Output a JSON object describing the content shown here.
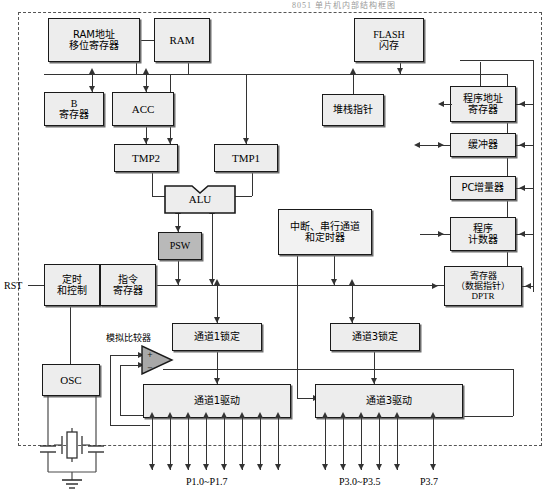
{
  "diagram": {
    "title": "8051 单片机内部结构框图",
    "external_labels": {
      "rst": "RST",
      "comparator": "模拟比较器",
      "port1_pins": "P1.0~P1.7",
      "port3_pins": "P3.0~P3.5",
      "port37_pin": "P3.7"
    },
    "blocks": {
      "ram_addr": "RAM地址\n移位寄存器",
      "ram_addr_l1": "RAM地址",
      "ram_addr_l2": "移位寄存器",
      "ram": "RAM",
      "flash_l1": "FLASH",
      "flash_l2": "闪存",
      "breg_l1": "B",
      "breg_l2": "寄存器",
      "acc": "ACC",
      "stack_pointer": "堆栈指针",
      "prog_addr_l1": "程序地址",
      "prog_addr_l2": "寄存器",
      "buffer": "缓冲器",
      "pc_incrementer": "PC增量器",
      "prog_counter_l1": "程序",
      "prog_counter_l2": "计数器",
      "dptr_l1": "寄存器",
      "dptr_l2": "（数据指针）",
      "dptr_l3": "DPTR",
      "tmp2": "TMP2",
      "tmp1": "TMP1",
      "alu": "ALU",
      "psw": "PSW",
      "interrupt_l1": "中断、串行通道",
      "interrupt_l2": "和定时器",
      "timing_l1": "定时",
      "timing_l2": "和控制",
      "instr_reg_l1": "指令",
      "instr_reg_l2": "寄存器",
      "osc": "OSC",
      "ch1_latch": "通道1锁定",
      "ch3_latch": "通道3锁定",
      "ch1_driver": "通道1驱动",
      "ch3_driver": "通道3驱动",
      "comparator_plus": "+",
      "comparator_minus": "−"
    },
    "colors": {
      "block_fill": "#ededed",
      "block_fill_dark": "#b9b9b9",
      "border": "#1a1a1a",
      "line": "#4a4a4a",
      "boundary": "#555555"
    }
  }
}
